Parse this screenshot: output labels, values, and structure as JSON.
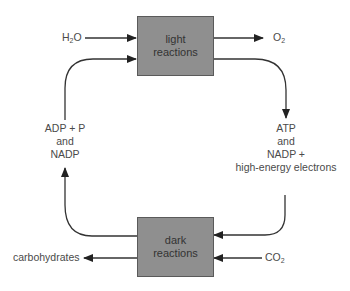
{
  "diagram": {
    "boxes": {
      "light": {
        "line1": "light",
        "line2": "reactions"
      },
      "dark": {
        "line1": "dark",
        "line2": "reactions"
      }
    },
    "inputs": {
      "water": {
        "base": "H",
        "sub": "2",
        "tail": "O"
      },
      "co2": {
        "base": "CO",
        "sub": "2"
      }
    },
    "outputs": {
      "oxygen": {
        "base": "O",
        "sub": "2"
      },
      "carbohydrates": "carbohydrates"
    },
    "cycle": {
      "to_dark": {
        "line1": "ATP",
        "line2": "and",
        "line3": "NADP +",
        "line4": "high-energy electrons"
      },
      "to_light": {
        "line1": "ADP + P",
        "line2": "and",
        "line3": "NADP"
      }
    },
    "colors": {
      "box_fill": "#8f8f8f",
      "line": "#333333",
      "text": "#4a4a4a"
    }
  }
}
